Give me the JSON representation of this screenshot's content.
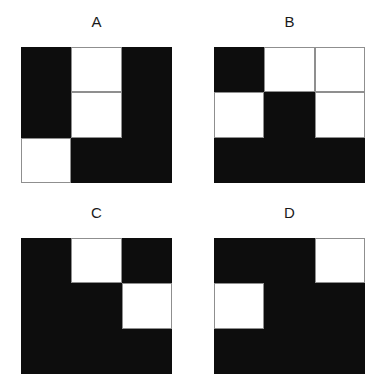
{
  "figure": {
    "background_color": "#ffffff",
    "black_color": "#0d0d0d",
    "white_color": "#ffffff",
    "grid_line_color": "#8f8f8f",
    "rows": 3,
    "cols": 3
  },
  "panels": [
    {
      "id": "a",
      "label": "A",
      "cells": [
        [
          "black",
          "white",
          "black"
        ],
        [
          "black",
          "white",
          "black"
        ],
        [
          "white",
          "black",
          "black"
        ]
      ]
    },
    {
      "id": "b",
      "label": "B",
      "cells": [
        [
          "black",
          "white",
          "white"
        ],
        [
          "white",
          "black",
          "white"
        ],
        [
          "black",
          "black",
          "black"
        ]
      ]
    },
    {
      "id": "c",
      "label": "C",
      "cells": [
        [
          "black",
          "white",
          "black"
        ],
        [
          "black",
          "black",
          "white"
        ],
        [
          "black",
          "black",
          "black"
        ]
      ]
    },
    {
      "id": "d",
      "label": "D",
      "cells": [
        [
          "black",
          "black",
          "white"
        ],
        [
          "white",
          "black",
          "black"
        ],
        [
          "black",
          "black",
          "black"
        ]
      ]
    }
  ]
}
